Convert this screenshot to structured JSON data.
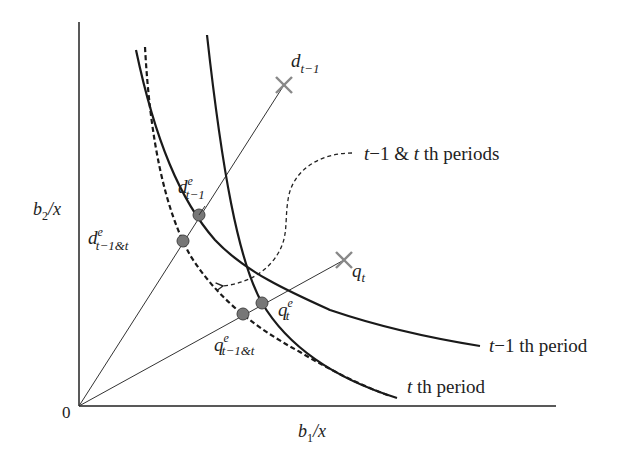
{
  "axes": {
    "x_label_main": "b",
    "x_label_sub": "1",
    "x_label_tail": "/x",
    "y_label_main": "b",
    "y_label_sub": "2",
    "y_label_tail": "/x",
    "origin_label": "0"
  },
  "curves": {
    "t_minus_1": {
      "label_var": "t",
      "label_rest": "−1 th period"
    },
    "t": {
      "label_var": "t",
      "label_rest": " th period"
    },
    "combined": {
      "label_var1": "t",
      "label_mid": "−1 & ",
      "label_var2": "t",
      "label_rest": " th periods"
    }
  },
  "points": {
    "d_t_minus_1": {
      "main": "d",
      "sub": "t−1"
    },
    "d_e_t_minus_1": {
      "main": "d",
      "sup": "e",
      "sub": "t−1"
    },
    "d_e_combined": {
      "main": "d",
      "sup": "e",
      "sub": "t−1&t"
    },
    "q_t": {
      "main": "q",
      "sub": "t"
    },
    "q_e_t": {
      "main": "q",
      "sup": "e",
      "sub": "t"
    },
    "q_e_combined": {
      "main": "q",
      "sup": "e",
      "sub": "t−1&t"
    }
  },
  "colors": {
    "axis": "#222222",
    "curve": "#1a1a1a",
    "point_fill": "#777777",
    "cross": "#888888"
  }
}
